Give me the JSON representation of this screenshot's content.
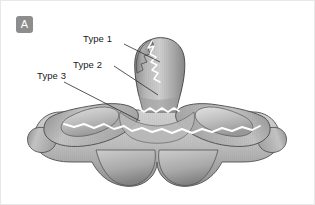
{
  "figure": {
    "panel_label": "A",
    "background_color": "#ffffff",
    "border_color": "#e8e8e8",
    "badge_color": "#8d8d8d",
    "badge_text_color": "#ffffff"
  },
  "callouts": [
    {
      "id": "type1",
      "label": "Type 1",
      "x": 83,
      "y": 33
    },
    {
      "id": "type2",
      "label": "Type 2",
      "x": 73,
      "y": 59
    },
    {
      "id": "type3",
      "label": "Type 3",
      "x": 37,
      "y": 70
    }
  ],
  "illustration": {
    "type": "anatomical-line-drawing",
    "bone_fill_light": "#d8d8d8",
    "bone_fill_mid": "#b4b4b4",
    "bone_fill_dark": "#8f8f8f",
    "outline_color": "#4a4a4a",
    "fracture_line_color": "#ffffff",
    "leader_line_color": "#2b2b2b"
  }
}
